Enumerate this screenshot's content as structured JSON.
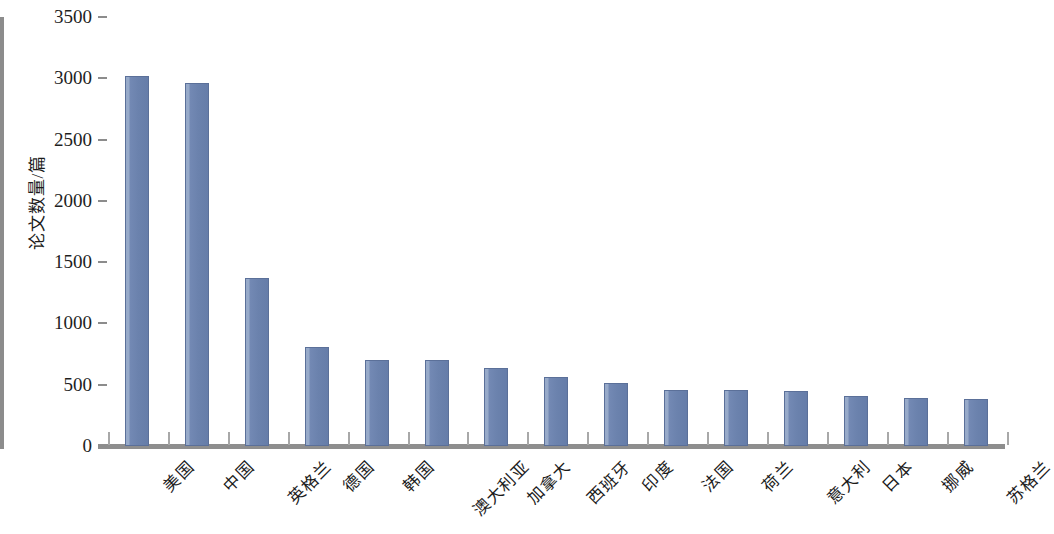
{
  "chart_data": {
    "type": "bar",
    "title": "",
    "subtitle": "",
    "xlabel": "",
    "ylabel": "论文数量/篇",
    "ylim": [
      0,
      3500
    ],
    "ytick_step": 500,
    "yticks": [
      0,
      500,
      1000,
      1500,
      2000,
      2500,
      3000,
      3500
    ],
    "grid": false,
    "legend": false,
    "bar_color": "#6b82ad",
    "bar_edge_color": "#5b7099",
    "axis_color": "#8c8c8c",
    "categories": [
      "美国",
      "中国",
      "英格兰",
      "德国",
      "韩国",
      "澳大利亚",
      "加拿大",
      "西班牙",
      "印度",
      "法国",
      "荷兰",
      "意大利",
      "日本",
      "挪威",
      "苏格兰"
    ],
    "values": [
      3020,
      2960,
      1370,
      810,
      700,
      700,
      640,
      565,
      515,
      460,
      455,
      445,
      405,
      390,
      380
    ],
    "xtick_label_rotation": -45
  }
}
